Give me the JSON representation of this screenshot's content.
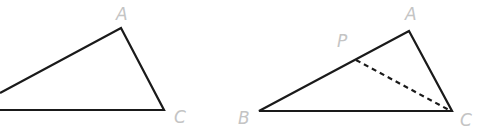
{
  "colors": {
    "background": "#ffffff",
    "stroke": "#1a1a1a",
    "label": "#c4c4c4"
  },
  "figure_left": {
    "name": "triangle-ABC-partial",
    "labels": {
      "A": "A",
      "C": "C"
    },
    "points": {
      "A": [
        121,
        28
      ],
      "C": [
        164,
        110
      ],
      "upper_left_edge": [
        0,
        93
      ],
      "base_left_edge": [
        0,
        110
      ]
    },
    "label_positions": {
      "A": [
        116,
        20
      ],
      "C": [
        174,
        123
      ]
    }
  },
  "figure_right": {
    "name": "triangle-ABC-with-P",
    "labels": {
      "A": "A",
      "B": "B",
      "C": "C",
      "P": "P"
    },
    "points": {
      "A": [
        409,
        31
      ],
      "B": [
        259,
        111
      ],
      "C": [
        452,
        111
      ],
      "P": [
        356,
        60
      ]
    },
    "segment_dashed": "PC",
    "label_positions": {
      "A": [
        405,
        20
      ],
      "P": [
        337,
        47
      ],
      "B": [
        238,
        124
      ],
      "C": [
        460,
        126
      ]
    }
  }
}
